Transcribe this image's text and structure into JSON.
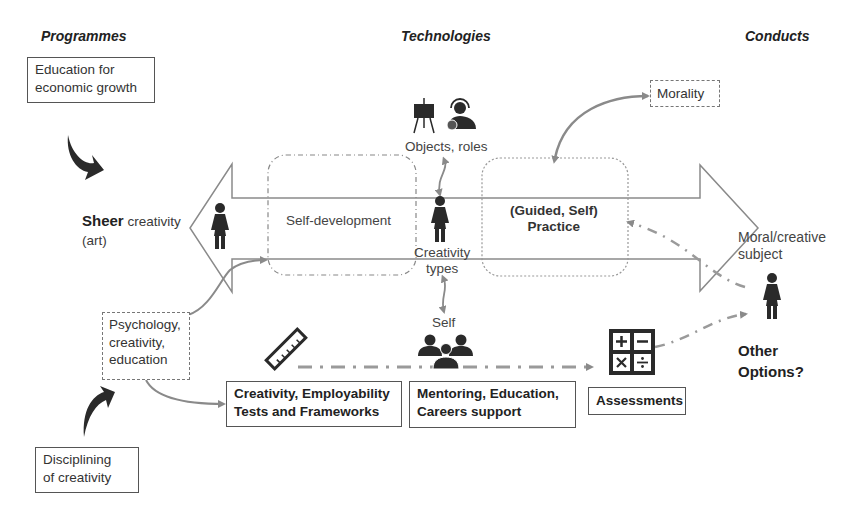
{
  "headers": {
    "programmes": "Programmes",
    "technologies": "Technologies",
    "conducts": "Conducts"
  },
  "programmes": {
    "top": [
      "Education for",
      "economic growth"
    ],
    "bottom": [
      "Disciplining",
      "of creativity"
    ]
  },
  "left_pole": {
    "bold": "Sheer",
    "rest": " creativity",
    "line2": "(art)"
  },
  "main_arrow": {
    "self_development": "Self-development",
    "guided_practice": [
      "(Guided, Self)",
      "Practice"
    ],
    "creativity_types": [
      "Creativity",
      "types"
    ]
  },
  "objects_roles": "Objects, roles",
  "morality": "Morality",
  "self_label": "Self",
  "psychology": [
    "Psychology,",
    "creativity,",
    "education"
  ],
  "bottom_boxes": {
    "tests": [
      "Creativity, Employability",
      "Tests and Frameworks"
    ],
    "mentoring": [
      "Mentoring, Education,",
      "Careers support"
    ],
    "assessments": "Assessments"
  },
  "conducts": {
    "subject": [
      "Moral/creative",
      "subject"
    ],
    "other": [
      "Other",
      "Options?"
    ]
  },
  "icons": {
    "easel": "easel-icon",
    "headset_person": "headset-person-icon",
    "person": "person-icon",
    "group": "group-icon",
    "ruler": "ruler-icon",
    "calculator": "calculator-icon",
    "curved_arrow": "curved-arrow-icon"
  },
  "colors": {
    "line": "#8a8a8a",
    "dark": "#2a2a2a",
    "box_border": "#555555",
    "dashed": "#888888"
  }
}
